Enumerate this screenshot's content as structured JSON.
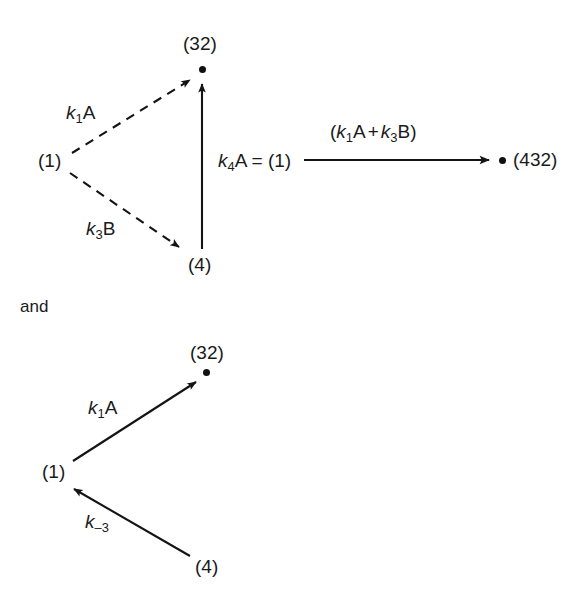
{
  "figure": {
    "background_color": "#ffffff",
    "ink_color": "#1a1a1a",
    "conjunction": "and",
    "diagrams": [
      {
        "id": "top",
        "nodes": [
          {
            "name": "source-1",
            "label": "(1)",
            "x": 52,
            "y": 161
          },
          {
            "name": "target-32",
            "label": "(32)",
            "x": 197,
            "y": 44,
            "dot": true,
            "dot_x": 202,
            "dot_y": 70
          },
          {
            "name": "intermediate-4",
            "label": "(4)",
            "x": 202,
            "y": 265
          },
          {
            "name": "product-432",
            "label": "(432)",
            "x": 537,
            "y": 161,
            "dot": true,
            "dot_x": 502,
            "dot_y": 160
          }
        ],
        "edges": [
          {
            "name": "edge-k1A-dashed",
            "label": "k1A",
            "style": "dashed",
            "from": "(1)",
            "to": "(32)"
          },
          {
            "name": "edge-k3B-dashed",
            "label": "k3B",
            "style": "dashed",
            "from": "(1)",
            "to": "(4)"
          },
          {
            "name": "edge-k4A-vertical",
            "label": "k4A = (1)",
            "style": "solid",
            "from": "(4)",
            "to": "(32)"
          },
          {
            "name": "edge-sum-horizontal",
            "label": "(k1A + k3B)",
            "style": "solid",
            "from": "(1)",
            "to": "(432)"
          }
        ],
        "labels": {
          "k1A": {
            "k": "k",
            "sub": "1",
            "rest": "A",
            "x": 66,
            "y": 113
          },
          "k3B": {
            "k": "k",
            "sub": "3",
            "rest": "B",
            "x": 86,
            "y": 229
          },
          "k4A": {
            "k": "k",
            "sub": "4",
            "rest": "A = (1)",
            "x": 218,
            "y": 161
          },
          "sum": {
            "open": "(",
            "k1": "k",
            "sub1": "1",
            "a": "A",
            "plus": "+",
            "k3": "k",
            "sub3": "3",
            "b": "B",
            "close": ")",
            "x": 330,
            "y": 134
          }
        }
      },
      {
        "id": "bottom",
        "nodes": [
          {
            "name": "source-1",
            "label": "(1)",
            "x": 42,
            "y": 472
          },
          {
            "name": "target-32",
            "label": "(32)",
            "x": 190,
            "y": 353,
            "dot": true,
            "dot_x": 206,
            "dot_y": 372
          },
          {
            "name": "source-4",
            "label": "(4)",
            "x": 195,
            "y": 567
          }
        ],
        "edges": [
          {
            "name": "edge-k1A-solid",
            "label": "k1A",
            "style": "solid",
            "from": "(1)",
            "to": "(32)"
          },
          {
            "name": "edge-kminus3-solid",
            "label": "k-3",
            "style": "solid",
            "from": "(4)",
            "to": "(1)"
          }
        ],
        "labels": {
          "k1A": {
            "k": "k",
            "sub": "1",
            "rest": "A",
            "x": 88,
            "y": 409
          },
          "kminus3": {
            "k": "k",
            "sub": "–3",
            "rest": "",
            "x": 85,
            "y": 523
          }
        }
      }
    ]
  },
  "text": {
    "node_1_top": "(1)",
    "node_32_top": "(32)",
    "node_4_top": "(4)",
    "node_432_top": "(432)",
    "node_1_bottom": "(1)",
    "node_32_bottom": "(32)",
    "node_4_bottom": "(4)",
    "and": "and",
    "k_italic": "k",
    "sub_1": "1",
    "sub_3": "3",
    "sub_4": "4",
    "sub_minus3": "–3",
    "A": "A",
    "B": "B",
    "k4A_tail": "A = (1)",
    "paren_open": "(",
    "paren_close": ")",
    "plus": "+"
  }
}
